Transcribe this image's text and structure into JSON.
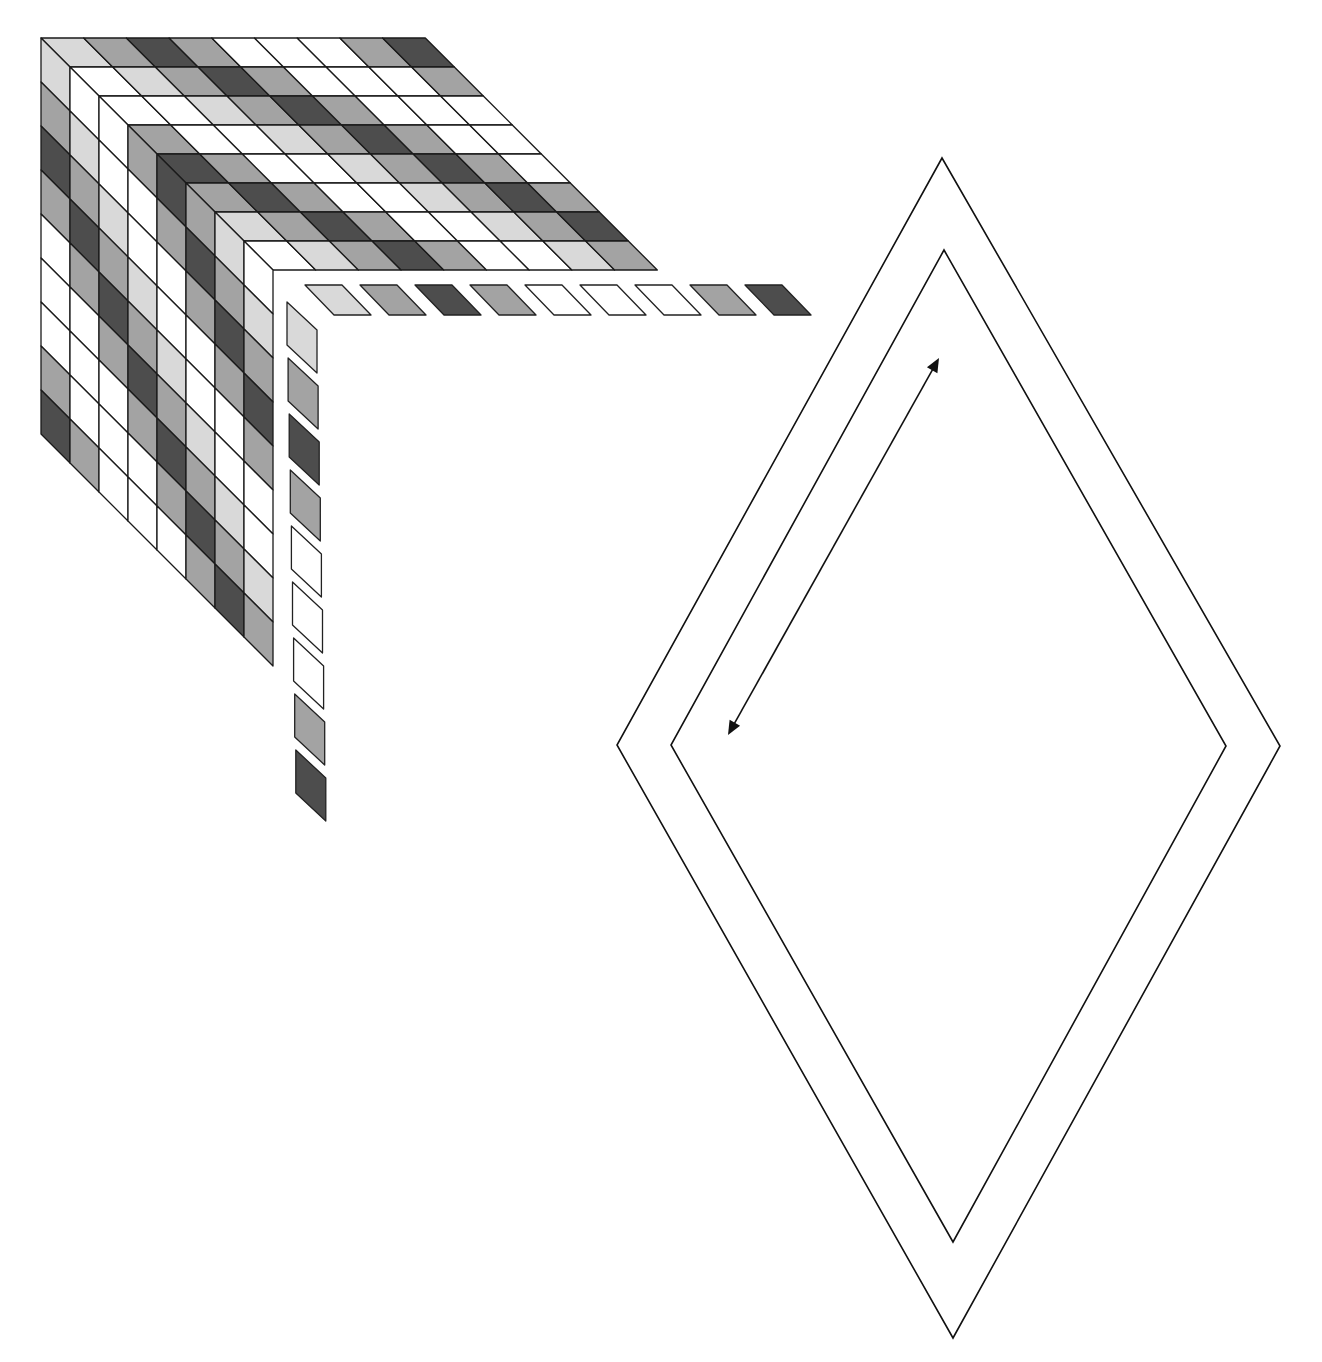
{
  "figure": {
    "type": "geometric-diagram"
  },
  "palette": {
    "W": "#ffffff",
    "L": "#d9d9d9",
    "M": "#a3a3a3",
    "D": "#4d4d4d"
  },
  "grid": {
    "layers": 8,
    "cells_per_layer": 9,
    "sequence": [
      "W",
      "W",
      "L",
      "M",
      "D",
      "M",
      "W",
      "W",
      "L",
      "M",
      "D",
      "M",
      "W",
      "W",
      "W",
      "M",
      "D"
    ],
    "rule": "cell(layer r, index c) = sequence[c - r + 8]; top face and left face are mirror-symmetric"
  },
  "detached_strip": {
    "horizontal_tiles": [
      "L",
      "M",
      "D",
      "M",
      "W",
      "W",
      "W",
      "M",
      "D"
    ],
    "vertical_tiles": [
      "L",
      "M",
      "D",
      "M",
      "W",
      "W",
      "W",
      "M",
      "D"
    ]
  },
  "rhombus": {
    "outer": {
      "top": [
        942,
        158
      ],
      "right": [
        1280,
        746
      ],
      "bottom": [
        953,
        1338
      ],
      "left": [
        617,
        745
      ]
    },
    "inner": {
      "top": [
        944,
        250
      ],
      "right": [
        1226,
        746
      ],
      "bottom": [
        953,
        1242
      ],
      "left": [
        671,
        745
      ]
    },
    "arrow": {
      "start": [
        728,
        735
      ],
      "end": [
        939,
        358
      ],
      "bidirectional": true
    }
  }
}
